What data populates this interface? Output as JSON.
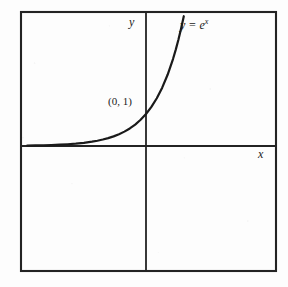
{
  "figure": {
    "background_color": "#fdfdfd",
    "ink_color": "#1a1a1a",
    "frame": {
      "x": 20,
      "y": 11,
      "width": 257,
      "height": 261,
      "stroke_width": 2
    }
  },
  "chart_data": {
    "type": "line",
    "title": "",
    "subtitle": "",
    "xlabel": "x",
    "ylabel": "y",
    "equation_label": "y = e",
    "equation_exponent": "x",
    "annotations": [
      {
        "name": "y-intercept",
        "text": "(0, 1)",
        "x": 0,
        "y": 1
      }
    ],
    "legend": [],
    "legend_position": "none",
    "grid": false,
    "axes_style": "cartesian-cross",
    "xlim": [
      -5.3,
      4.4
    ],
    "ylim": [
      -4.2,
      4.6
    ],
    "origin_px": {
      "x": 146,
      "y": 146
    },
    "px_per_unit": {
      "x": 27.0,
      "y": 32.0
    },
    "series": [
      {
        "name": "y = e^x",
        "function": "exp(x)",
        "stroke_width": 2.2,
        "color": "#1a1a1a",
        "x": [
          -4.7,
          -4.4,
          -4.1,
          -3.8,
          -3.5,
          -3.2,
          -2.9,
          -2.6,
          -2.3,
          -2.0,
          -1.8,
          -1.6,
          -1.4,
          -1.2,
          -1.0,
          -0.8,
          -0.6,
          -0.4,
          -0.2,
          0.0,
          0.2,
          0.4,
          0.6,
          0.8,
          1.0,
          1.1,
          1.2,
          1.3,
          1.4,
          1.45
        ],
        "y": [
          0.009,
          0.012,
          0.017,
          0.022,
          0.03,
          0.041,
          0.055,
          0.074,
          0.1,
          0.135,
          0.165,
          0.202,
          0.247,
          0.301,
          0.368,
          0.449,
          0.549,
          0.67,
          0.819,
          1.0,
          1.221,
          1.492,
          1.822,
          2.226,
          2.718,
          3.004,
          3.32,
          3.669,
          4.055,
          4.263
        ]
      }
    ]
  },
  "labels": {
    "y_axis": "y",
    "x_axis": "x",
    "y_intercept": "(0, 1)",
    "curve_base": "y = e",
    "curve_exponent": "x"
  }
}
